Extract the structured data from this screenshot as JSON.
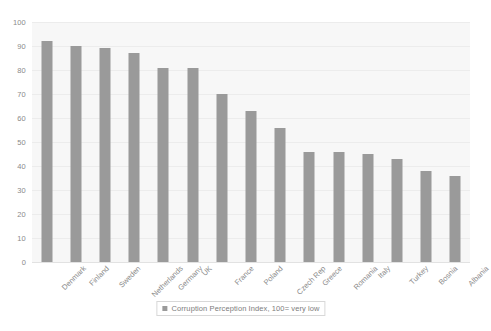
{
  "chart_data": {
    "type": "bar",
    "title": "",
    "xlabel": "",
    "ylabel": "",
    "ylim": [
      0,
      100
    ],
    "ytick_step": 10,
    "grid": true,
    "legend_position": "bottom",
    "bar_color": "#9a9a9a",
    "plot_background": "#f7f7f7",
    "categories": [
      "Denmark",
      "Finland",
      "Sweden",
      "Netherlands",
      "Germany",
      "UK",
      "France",
      "Poland",
      "Czech Rep",
      "Greece",
      "Romania",
      "Italy",
      "Turkey",
      "Bosnia",
      "Albania"
    ],
    "values": [
      92,
      90,
      89,
      87,
      81,
      81,
      70,
      63,
      56,
      46,
      46,
      45,
      43,
      38,
      36
    ],
    "yticks": [
      "0",
      "10",
      "20",
      "30",
      "40",
      "50",
      "60",
      "70",
      "80",
      "90",
      "100"
    ],
    "series": [
      {
        "name": "Corruption Perception Index, 100= very low",
        "values": [
          92,
          90,
          89,
          87,
          81,
          81,
          70,
          63,
          56,
          46,
          46,
          45,
          43,
          38,
          36
        ]
      }
    ],
    "legend": [
      "Corruption Perception Index, 100= very low"
    ]
  }
}
